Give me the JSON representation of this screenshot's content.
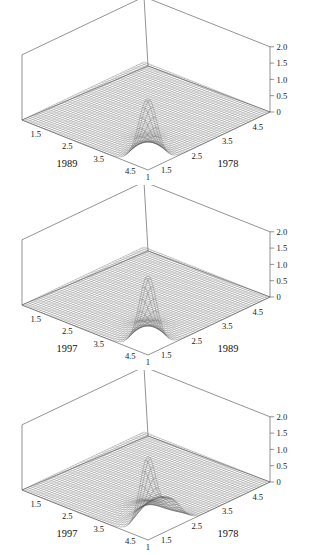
{
  "figure": {
    "background_color": "#ffffff",
    "line_color": "#4a4a4a",
    "mesh_color": "#555555",
    "text_color": "#1a1a1a",
    "panel_count": 3
  },
  "chart_data": [
    {
      "type": "surface",
      "title": "",
      "xlabel": "1989",
      "ylabel": "1978",
      "zlabel": "",
      "origin_label": "1",
      "xticklabels": [
        "1.5",
        "2.5",
        "3.5",
        "4.5"
      ],
      "yticklabels": [
        "1.5",
        "2.5",
        "3.5",
        "4.5"
      ],
      "zticklabels": [
        "0",
        "0.5",
        "1.0",
        "1.5",
        "2.0"
      ],
      "xlim": [
        1,
        5
      ],
      "ylim": [
        1,
        5
      ],
      "zlim": [
        0,
        2.0
      ],
      "grid": false,
      "legend": "none",
      "peak": {
        "x": 1.0,
        "y": 1.0,
        "z": 2.05,
        "width": 0.28
      },
      "secondary_peaks": [
        {
          "x": 1.45,
          "y": 1.45,
          "z": 0.33,
          "width": 0.3
        },
        {
          "x": 1.95,
          "y": 1.95,
          "z": 0.13,
          "width": 0.32
        }
      ],
      "ridge_amplitude": 0.1
    },
    {
      "type": "surface",
      "title": "",
      "xlabel": "1997",
      "ylabel": "1989",
      "zlabel": "",
      "origin_label": "1",
      "xticklabels": [
        "1.5",
        "2.5",
        "3.5",
        "4.5"
      ],
      "yticklabels": [
        "1.5",
        "2.5",
        "3.5",
        "4.5"
      ],
      "zticklabels": [
        "0",
        "0.5",
        "1.0",
        "1.5",
        "2.0"
      ],
      "xlim": [
        1,
        5
      ],
      "ylim": [
        1,
        5
      ],
      "zlim": [
        0,
        2.0
      ],
      "grid": false,
      "legend": "none",
      "peak": {
        "x": 1.0,
        "y": 1.0,
        "z": 2.25,
        "width": 0.26
      },
      "secondary_peaks": [
        {
          "x": 1.4,
          "y": 1.4,
          "z": 0.4,
          "width": 0.3
        },
        {
          "x": 1.9,
          "y": 1.9,
          "z": 0.18,
          "width": 0.32
        }
      ],
      "ridge_amplitude": 0.11
    },
    {
      "type": "surface",
      "title": "",
      "xlabel": "1997",
      "ylabel": "1978",
      "zlabel": "",
      "origin_label": "1",
      "xticklabels": [
        "1.5",
        "2.5",
        "3.5",
        "4.5"
      ],
      "yticklabels": [
        "1.5",
        "2.5",
        "3.5",
        "4.5"
      ],
      "zticklabels": [
        "0",
        "0.5",
        "1.0",
        "1.5",
        "2.0"
      ],
      "xlim": [
        1,
        5
      ],
      "ylim": [
        1,
        5
      ],
      "zlim": [
        0,
        2.0
      ],
      "grid": false,
      "legend": "none",
      "peak": {
        "x": 1.0,
        "y": 1.0,
        "z": 2.35,
        "width": 0.25
      },
      "secondary_peaks": [
        {
          "x": 1.0,
          "y": 1.75,
          "z": 0.82,
          "width": 0.34
        },
        {
          "x": 1.55,
          "y": 1.55,
          "z": 0.4,
          "width": 0.3
        },
        {
          "x": 2.05,
          "y": 2.05,
          "z": 0.22,
          "width": 0.32
        }
      ],
      "ridge_amplitude": 0.12
    }
  ],
  "panels": [
    {
      "name": "panel-1989-1978",
      "top": 0
    },
    {
      "name": "panel-1997-1989",
      "top": 185
    },
    {
      "name": "panel-1997-1978",
      "top": 370
    }
  ]
}
